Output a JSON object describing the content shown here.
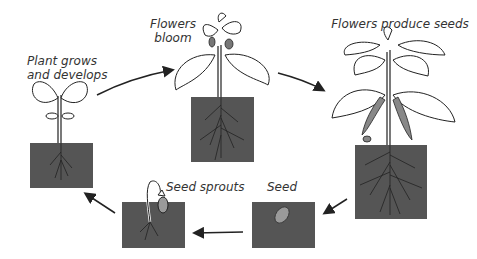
{
  "diagram": {
    "stages": [
      {
        "id": "seed",
        "label": "Seed"
      },
      {
        "id": "seed_sprouts",
        "label": "Seed sprouts"
      },
      {
        "id": "plant_grows",
        "label_line1": "Plant grows",
        "label_line2": "and develops"
      },
      {
        "id": "flowers_bloom",
        "label_line1": "Flowers",
        "label_line2": "bloom"
      },
      {
        "id": "flowers_produce_seeds",
        "label": "Flowers produce seeds"
      }
    ],
    "colors": {
      "soil": "#555555",
      "seed": "#9a9a9a",
      "line": "#222222",
      "leaf_fill": "#ffffff"
    }
  }
}
